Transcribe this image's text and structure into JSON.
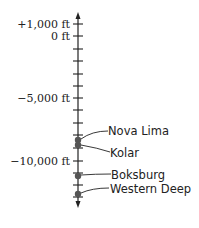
{
  "diagram": {
    "type": "vertical-number-line",
    "unit": "ft",
    "axis_labels": [
      {
        "value": 1000,
        "text": "+1,000 ft"
      },
      {
        "value": 0,
        "text": "0 ft"
      },
      {
        "value": -5000,
        "text": "−5,000 ft"
      },
      {
        "value": -10000,
        "text": "−10,000 ft"
      }
    ],
    "tick_interval": 1000,
    "range": [
      1000,
      -13000
    ],
    "mines": [
      {
        "name": "Nova Lima",
        "depth": -8300
      },
      {
        "name": "Kolar",
        "depth": -8800
      },
      {
        "name": "Boksburg",
        "depth": -11000
      },
      {
        "name": "Western Deep",
        "depth": -12700
      }
    ],
    "colors": {
      "line": "#222222",
      "dot": "#555555"
    }
  }
}
